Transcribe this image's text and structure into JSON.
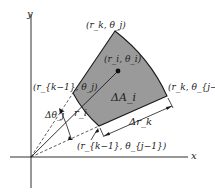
{
  "diagram": {
    "type": "polar-subrectangle",
    "colors": {
      "region_fill": "#9a9a9a",
      "stroke": "#1a1a1a",
      "dashed": "#333333",
      "text": "#222222",
      "background": "#ffffff"
    },
    "axes": {
      "x_label": "x",
      "y_label": "y"
    },
    "labels": {
      "outer_top_corner": "(r_k, θ_j)",
      "center_point": "(r_i, θ_i)",
      "inner_top_corner": "(r_{k−1}, θ_j)",
      "outer_right_corner": "(r_k, θ_{j−1})",
      "inner_bottom_corner": "(r_{k−1}, θ_{j−1})",
      "area": "ΔA_i",
      "delta_theta": "Δθ_j",
      "radius": "r_i",
      "delta_r": "Δr_k"
    },
    "points": {
      "origin": [
        31,
        157
      ],
      "outer_top": [
        115,
        31
      ],
      "outer_right": [
        167,
        96
      ],
      "inner_top": [
        73,
        93
      ],
      "inner_bottom": [
        99,
        126
      ],
      "center": [
        118,
        71
      ]
    }
  }
}
